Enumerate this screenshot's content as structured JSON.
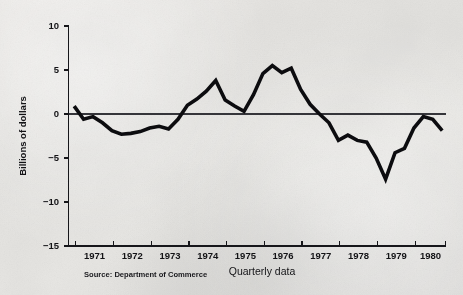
{
  "chart_data": {
    "type": "line",
    "title": "",
    "subtitle": "",
    "xlabel": "Quarterly data",
    "ylabel": "Billions of dollars",
    "source": "Source: Department of Commerce",
    "grid": false,
    "legend": "none",
    "zero_reference_line": true,
    "xlim": [
      1970.75,
      1980.75
    ],
    "ylim": [
      -15,
      10
    ],
    "yticks": [
      10,
      5,
      0,
      -5,
      -10,
      -15
    ],
    "ytick_labels": [
      "10",
      "5",
      "0",
      "−5",
      "−10",
      "−15"
    ],
    "xticks": [
      1971,
      1972,
      1973,
      1974,
      1975,
      1976,
      1977,
      1978,
      1979,
      1980,
      1981
    ],
    "xtick_labels": [
      "1971",
      "1972",
      "1973",
      "1974",
      "1975",
      "1976",
      "1977",
      "1978",
      "1979",
      "1980"
    ],
    "series": [
      {
        "name": "Quarterly balance",
        "color": "#0c0c0f",
        "x": [
          1970.9,
          1971.15,
          1971.4,
          1971.65,
          1971.9,
          1972.15,
          1972.4,
          1972.65,
          1972.9,
          1973.15,
          1973.4,
          1973.65,
          1973.9,
          1974.15,
          1974.4,
          1974.65,
          1974.9,
          1975.15,
          1975.4,
          1975.65,
          1975.9,
          1976.15,
          1976.4,
          1976.65,
          1976.9,
          1977.15,
          1977.4,
          1977.65,
          1977.9,
          1978.15,
          1978.4,
          1978.65,
          1978.9,
          1979.15,
          1979.4,
          1979.65,
          1979.9,
          1980.15,
          1980.4,
          1980.65
        ],
        "values": [
          0.9,
          -0.6,
          -0.3,
          -1.0,
          -1.9,
          -2.3,
          -2.2,
          -2.0,
          -1.6,
          -1.4,
          -1.7,
          -0.6,
          1.0,
          1.7,
          2.6,
          3.8,
          1.6,
          0.9,
          0.3,
          2.2,
          4.6,
          5.5,
          4.7,
          5.2,
          2.8,
          1.1,
          0.0,
          -1.0,
          -3.0,
          -2.4,
          -3.0,
          -3.2,
          -5.0,
          -7.4,
          -4.4,
          -3.9,
          -1.6,
          -0.3,
          -0.6,
          -1.9
        ]
      }
    ],
    "annotations": []
  },
  "axis": {
    "y_title": "Billions of dollars",
    "x_title": "Quarterly data"
  },
  "footer": {
    "source": "Source: Department of Commerce"
  },
  "colors": {
    "line": "#0c0c0f",
    "axis": "#16161a",
    "background": "#e8e8e6"
  }
}
